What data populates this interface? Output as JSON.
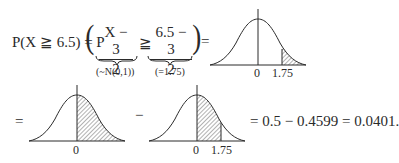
{
  "equation": {
    "lhs": "P(X ≧ 6.5) = P",
    "paren_open": "(",
    "frac1": {
      "numerator": "X − 3",
      "denominator": "2"
    },
    "relation": "≧",
    "frac2": {
      "numerator": "6.5 − 3",
      "denominator": "2"
    },
    "paren_close": ")",
    "equals1": "=",
    "annotation1": "(~N(0,1))",
    "annotation2": "(=1.75)",
    "equals2": "=",
    "minus": "−",
    "result": "= 0.5 − 0.4599 = 0.0401."
  },
  "curves": [
    {
      "id": "tail-area",
      "shade_from": "1.75",
      "shade_to": "∞",
      "labels": [
        "0",
        "1.75"
      ]
    },
    {
      "id": "right-half",
      "shade_from": "0",
      "shade_to": "∞",
      "labels": [
        "0"
      ]
    },
    {
      "id": "zero-to-1.75",
      "shade_from": "0",
      "shade_to": "1.75",
      "labels": [
        "0",
        "1.75"
      ]
    }
  ]
}
